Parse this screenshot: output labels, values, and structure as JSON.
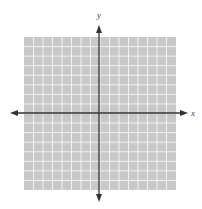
{
  "diagram": {
    "type": "coordinate-plane",
    "grid": {
      "columns": 16,
      "rows": 16,
      "x0": 24,
      "y0": 37,
      "width": 152,
      "height": 153,
      "fill_color": "#c8c8c8",
      "line_color": "#f2f2f2"
    },
    "axes": {
      "color": "#333333",
      "x_axis": {
        "label": "x",
        "y": 113,
        "x_start": 10,
        "x_end": 188
      },
      "y_axis": {
        "label": "y",
        "x": 99,
        "y_start": 25,
        "y_end": 202
      }
    }
  }
}
